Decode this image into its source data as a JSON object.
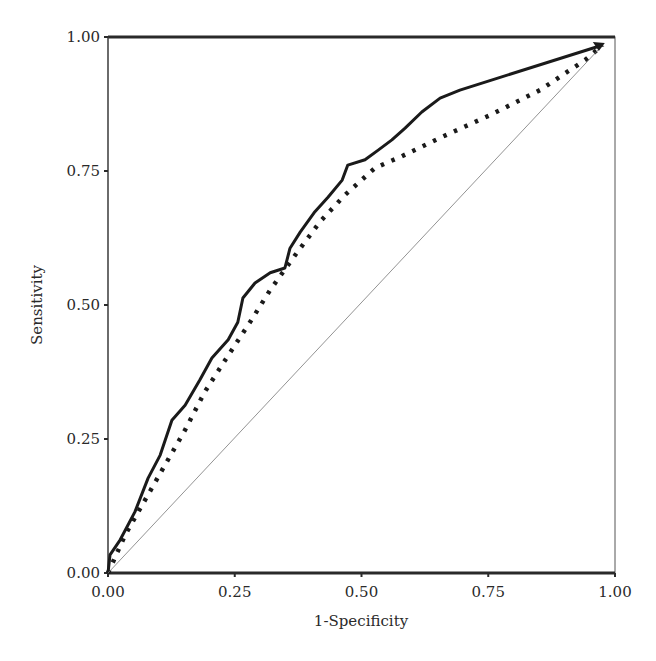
{
  "chart_data": {
    "type": "line",
    "title": "",
    "xlabel": "1-Specificity",
    "ylabel": "Sensitivity",
    "xlim": [
      0,
      1
    ],
    "ylim": [
      0,
      1
    ],
    "grid": false,
    "legend": null,
    "x_ticks": [
      "0.00",
      "0.25",
      "0.50",
      "0.75",
      "1.00"
    ],
    "y_ticks": [
      "0.00",
      "0.25",
      "0.50",
      "0.75",
      "1.00"
    ],
    "series": [
      {
        "name": "ROC curve (solid)",
        "style": "solid",
        "color": "#1a1a1a",
        "x": [
          0,
          0.004,
          0.024,
          0.053,
          0.079,
          0.103,
          0.126,
          0.152,
          0.181,
          0.205,
          0.237,
          0.256,
          0.266,
          0.29,
          0.32,
          0.349,
          0.359,
          0.379,
          0.408,
          0.434,
          0.462,
          0.473,
          0.507,
          0.533,
          0.56,
          0.586,
          0.619,
          0.655,
          0.694,
          0.976
        ],
        "y": [
          0,
          0.034,
          0.062,
          0.114,
          0.177,
          0.22,
          0.285,
          0.313,
          0.36,
          0.401,
          0.435,
          0.468,
          0.513,
          0.541,
          0.56,
          0.569,
          0.606,
          0.636,
          0.674,
          0.701,
          0.733,
          0.761,
          0.771,
          0.789,
          0.808,
          0.83,
          0.86,
          0.886,
          0.901,
          0.985
        ]
      },
      {
        "name": "ROC curve (dotted)",
        "style": "dotted",
        "color": "#1a1a1a",
        "x": [
          0,
          0.034,
          0.073,
          0.112,
          0.152,
          0.191,
          0.231,
          0.28,
          0.32,
          0.369,
          0.418,
          0.467,
          0.527,
          0.576,
          0.655,
          0.753,
          0.852,
          0.941,
          0.976
        ],
        "y": [
          0,
          0.071,
          0.136,
          0.201,
          0.267,
          0.338,
          0.397,
          0.468,
          0.528,
          0.593,
          0.655,
          0.705,
          0.756,
          0.776,
          0.812,
          0.854,
          0.901,
          0.957,
          0.985
        ]
      },
      {
        "name": "Reference line",
        "style": "thin",
        "color": "#777777",
        "x": [
          0,
          0.976
        ],
        "y": [
          0,
          0.985
        ]
      }
    ]
  },
  "labels": {
    "xlabel": "1-Specificity",
    "ylabel": "Sensitivity"
  }
}
